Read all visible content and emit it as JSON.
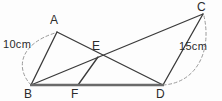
{
  "figure": {
    "colors": {
      "stroke": "#3a3a3a",
      "baseline": "#6a6a6a",
      "dashed_arc": "#9a9a9a",
      "text": "#2b2b2b",
      "background": "#fdfdfd"
    },
    "vertices": [
      {
        "name": "A",
        "label": "A",
        "x": 57,
        "y": 32,
        "label_x": 50,
        "label_y": 14
      },
      {
        "name": "B",
        "label": "B",
        "x": 31,
        "y": 85,
        "label_x": 24,
        "label_y": 88
      },
      {
        "name": "C",
        "label": "C",
        "x": 203,
        "y": 14,
        "label_x": 197,
        "label_y": 1
      },
      {
        "name": "D",
        "label": "D",
        "x": 163,
        "y": 85,
        "label_x": 156,
        "label_y": 88
      },
      {
        "name": "E",
        "label": "E",
        "x": 98,
        "y": 57,
        "label_x": 92,
        "label_y": 40
      },
      {
        "name": "F",
        "label": "F",
        "x": 78,
        "y": 85,
        "label_x": 71,
        "label_y": 88
      }
    ],
    "segments": [
      {
        "name": "segment-BA",
        "from": "B",
        "to": "A"
      },
      {
        "name": "segment-AD",
        "from": "A",
        "to": "D"
      },
      {
        "name": "segment-BC",
        "from": "B",
        "to": "C"
      },
      {
        "name": "segment-DC",
        "from": "D",
        "to": "C"
      },
      {
        "name": "segment-FE",
        "from": "F",
        "to": "E"
      },
      {
        "name": "segment-BD-baseline",
        "from": "B",
        "to": "D"
      }
    ],
    "arcs": [
      {
        "name": "dashed-arc-BA",
        "from": "B",
        "to": "A",
        "measure": "10cm"
      },
      {
        "name": "dashed-arc-DC",
        "from": "D",
        "to": "C",
        "measure": "15cm"
      }
    ],
    "measures": [
      {
        "name": "measure-left",
        "text": "10cm",
        "x": 3,
        "y": 39
      },
      {
        "name": "measure-right",
        "text": "15cm",
        "x": 179,
        "y": 41
      }
    ]
  }
}
